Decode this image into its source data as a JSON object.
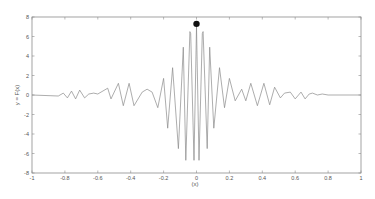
{
  "chart_data": {
    "type": "line",
    "title": "",
    "xlabel": "(x)",
    "ylabel": "y = F(x)",
    "xlim": [
      -1,
      1
    ],
    "ylim": [
      -8,
      8
    ],
    "grid": false,
    "legend": null,
    "xticks": [
      "-1",
      "-0.8",
      "-0.6",
      "-0.4",
      "-0.2",
      "0",
      "0.2",
      "0.4",
      "0.6",
      "0.8",
      "1"
    ],
    "yticks": [
      "-8",
      "-6",
      "-4",
      "-2",
      "0",
      "2",
      "4",
      "6",
      "8"
    ],
    "series": [
      {
        "name": "F(x)",
        "color": "#8a8a8a",
        "x": [
          -1.0,
          -0.84,
          -0.81,
          -0.785,
          -0.76,
          -0.735,
          -0.71,
          -0.68,
          -0.655,
          -0.625,
          -0.6,
          -0.54,
          -0.52,
          -0.475,
          -0.445,
          -0.41,
          -0.38,
          -0.33,
          -0.3,
          -0.27,
          -0.235,
          -0.2,
          -0.175,
          -0.145,
          -0.11,
          -0.08,
          -0.065,
          -0.04,
          -0.035,
          -0.015,
          0.0,
          0.015,
          0.035,
          0.04,
          0.065,
          0.08,
          0.105,
          0.14,
          0.17,
          0.2,
          0.235,
          0.275,
          0.3,
          0.33,
          0.37,
          0.41,
          0.445,
          0.475,
          0.51,
          0.535,
          0.57,
          0.6,
          0.635,
          0.66,
          0.685,
          0.705,
          0.735,
          0.765,
          0.8,
          1.0
        ],
        "y": [
          0.0,
          -0.1,
          0.2,
          -0.3,
          0.4,
          -0.4,
          0.5,
          -0.3,
          0.1,
          0.2,
          0.1,
          0.7,
          -0.4,
          1.2,
          -1.1,
          1.2,
          -1.1,
          0.3,
          0.6,
          0.3,
          -1.3,
          1.7,
          -3.4,
          2.8,
          -5.5,
          4.9,
          -6.7,
          6.5,
          6.3,
          -6.7,
          7.0,
          -6.7,
          6.3,
          6.5,
          -5.5,
          4.9,
          -3.4,
          2.8,
          -1.3,
          1.7,
          -0.6,
          0.6,
          -0.6,
          1.2,
          -1.1,
          1.2,
          -1.0,
          0.8,
          -0.3,
          0.2,
          0.3,
          -0.4,
          0.3,
          -0.4,
          0.1,
          0.2,
          0.0,
          0.1,
          0.0,
          0.0
        ]
      }
    ],
    "markers": [
      {
        "x": 0.0,
        "y": 7.3,
        "color": "#111111",
        "shape": "circle"
      }
    ]
  },
  "axes": {
    "x_label": "(x)",
    "y_label": "y = F(x)"
  }
}
